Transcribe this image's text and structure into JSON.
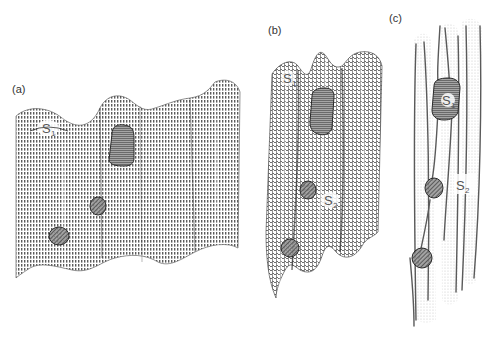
{
  "figure": {
    "panels": [
      {
        "id": "a",
        "label": "(a)",
        "description": "Corrugated wavy surface rendered with dense vertical dashed lines",
        "surface_labels": [
          {
            "main": "S",
            "sub": "1"
          }
        ],
        "blob_count": 3
      },
      {
        "id": "b",
        "label": "(b)",
        "description": "Deformed tubular mesh surface with vertical ridges",
        "surface_labels": [
          {
            "main": "S",
            "sub": "1"
          },
          {
            "main": "S",
            "sub": "2"
          }
        ],
        "blob_count": 3
      },
      {
        "id": "c",
        "label": "(c)",
        "description": "Sparse stippled line traces of tubular structures",
        "surface_labels": [
          {
            "main": "S",
            "sub": "1"
          },
          {
            "main": "S",
            "sub": "2"
          }
        ],
        "blob_count": 3
      }
    ],
    "colors": {
      "background": "#ffffff",
      "surface_lines": "#6e6e6e",
      "blob_fill": "#8a8a8a",
      "blob_stroke": "#2e2e2e",
      "label_text": "#333333"
    }
  }
}
